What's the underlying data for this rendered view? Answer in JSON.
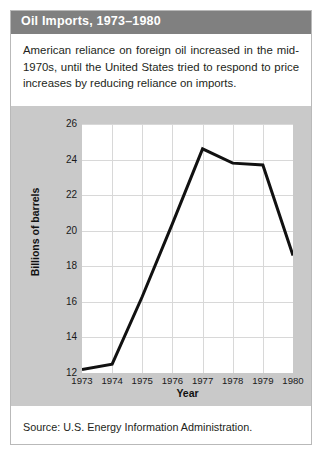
{
  "card": {
    "title": "Oil Imports, 1973–1980",
    "description": "American reliance on foreign oil increased in the mid-1970s, until the United States tried to respond to price increases by reducing reliance on imports.",
    "source": "Source: U.S. Energy Information Administration.",
    "colors": {
      "title_bar": "#808080",
      "title_text": "#ffffff",
      "chart_panel": "#c9c9c9",
      "plot_background": "#ffffff",
      "grid": "#d8d8d8",
      "line": "#111111",
      "card_border": "#b9b9b9",
      "body_text": "#231f20"
    }
  },
  "chart_data": {
    "type": "line",
    "title": "Oil Imports, 1973–1980",
    "xlabel": "Year",
    "ylabel": "Billions of barrels",
    "categories": [
      "1973",
      "1974",
      "1975",
      "1976",
      "1977",
      "1978",
      "1979",
      "1980"
    ],
    "x": [
      1973,
      1974,
      1975,
      1976,
      1977,
      1978,
      1979,
      1980
    ],
    "values": [
      12.2,
      12.5,
      16.3,
      20.4,
      24.6,
      23.8,
      23.7,
      18.6
    ],
    "series": [
      {
        "name": "Oil imports",
        "values": [
          12.2,
          12.5,
          16.3,
          20.4,
          24.6,
          23.8,
          23.7,
          18.6
        ]
      }
    ],
    "ylim": [
      12,
      26
    ],
    "yticks": [
      12,
      14,
      16,
      18,
      20,
      22,
      24,
      26
    ],
    "ytick_labels": [
      "12",
      "14",
      "16",
      "18",
      "20",
      "22",
      "24",
      "26"
    ],
    "xlim": [
      1973,
      1980
    ],
    "xticks": [
      1973,
      1974,
      1975,
      1976,
      1977,
      1978,
      1979,
      1980
    ],
    "xtick_labels": [
      "1973",
      "1974",
      "1975",
      "1976",
      "1977",
      "1978",
      "1979",
      "1980"
    ],
    "grid": true,
    "legend": false,
    "legend_position": "none",
    "line_width": 3,
    "markers": false
  }
}
